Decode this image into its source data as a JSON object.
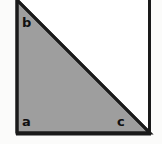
{
  "figure": {
    "kind": "right-triangle-diagram",
    "canvas": {
      "width": 162,
      "height": 144
    },
    "colors": {
      "page_background": "#fbfbfa",
      "panel_fill": "#ffffff",
      "triangle_fill": "#9e9e9e",
      "stroke": "#1a1a1a",
      "label_color": "#111111"
    },
    "panel": {
      "left": 16,
      "top": -6,
      "right": 150,
      "bottom": 133,
      "stroke_width": 3
    },
    "triangle": {
      "points": "17,0 17,133 150,133",
      "stroke_width": 3,
      "vertices": [
        {
          "name": "top-left",
          "x": 17,
          "y": 0
        },
        {
          "name": "bottom-left",
          "x": 17,
          "y": 133
        },
        {
          "name": "bottom-right",
          "x": 150,
          "y": 133
        }
      ]
    },
    "labels": {
      "b": "b",
      "a": "a",
      "c": "c"
    }
  }
}
